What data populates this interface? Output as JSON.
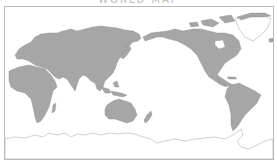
{
  "map": {
    "title": "WORLD MAP",
    "projection": "equirectangular, Pacific-centered",
    "colors": {
      "land": "#a6a6a6",
      "land_stroke": "#8c8c8c",
      "ice_outline": "#b0b0b0",
      "ocean": "#ffffff",
      "frame": "#b8b8b8"
    },
    "regions": [
      {
        "name": "Europe"
      },
      {
        "name": "Asia"
      },
      {
        "name": "Africa"
      },
      {
        "name": "Australia"
      },
      {
        "name": "New Zealand"
      },
      {
        "name": "North America"
      },
      {
        "name": "Greenland"
      },
      {
        "name": "South America"
      },
      {
        "name": "Antarctica"
      }
    ]
  }
}
